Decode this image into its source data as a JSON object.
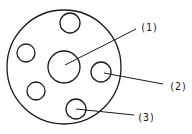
{
  "diagram": {
    "outer_circle": {
      "cx": 64,
      "cy": 67,
      "r": 57
    },
    "center_circle": {
      "cx": 64,
      "cy": 67,
      "r": 16
    },
    "small_circles": [
      {
        "cx": 70,
        "cy": 23,
        "r": 10
      },
      {
        "cx": 26,
        "cy": 53,
        "r": 9
      },
      {
        "cx": 101,
        "cy": 72,
        "r": 10
      },
      {
        "cx": 36,
        "cy": 91,
        "r": 9
      },
      {
        "cx": 76,
        "cy": 109,
        "r": 10
      }
    ],
    "labels": [
      {
        "text": "(1)",
        "x": 141,
        "y": 31
      },
      {
        "text": "(2)",
        "x": 171,
        "y": 90
      },
      {
        "text": "(3)",
        "x": 138,
        "y": 121
      }
    ],
    "stroke_color": "#1a1a1a"
  }
}
